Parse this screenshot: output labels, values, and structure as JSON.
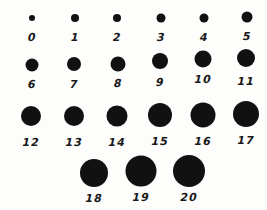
{
  "colors": {
    "dot": "#111111",
    "label": "#1a1a1a",
    "background": "#fdfdfc"
  },
  "dots": [
    {
      "label": "0",
      "x": 32,
      "y": 18,
      "d": 6,
      "ly": 37
    },
    {
      "label": "1",
      "x": 75,
      "y": 18,
      "d": 8,
      "ly": 37
    },
    {
      "label": "2",
      "x": 117,
      "y": 18,
      "d": 8,
      "ly": 37
    },
    {
      "label": "3",
      "x": 161,
      "y": 18,
      "d": 9,
      "ly": 37
    },
    {
      "label": "4",
      "x": 204,
      "y": 18,
      "d": 9,
      "ly": 37
    },
    {
      "label": "5",
      "x": 247,
      "y": 17,
      "d": 11,
      "ly": 36
    },
    {
      "label": "6",
      "x": 32,
      "y": 65,
      "d": 13,
      "ly": 84
    },
    {
      "label": "7",
      "x": 74,
      "y": 64,
      "d": 14,
      "ly": 84
    },
    {
      "label": "8",
      "x": 118,
      "y": 64,
      "d": 15,
      "ly": 83
    },
    {
      "label": "9",
      "x": 160,
      "y": 61,
      "d": 16,
      "ly": 82
    },
    {
      "label": "10",
      "x": 203,
      "y": 59,
      "d": 17,
      "ly": 79
    },
    {
      "label": "11",
      "x": 246,
      "y": 58,
      "d": 18,
      "ly": 81
    },
    {
      "label": "12",
      "x": 31,
      "y": 116,
      "d": 20,
      "ly": 142
    },
    {
      "label": "13",
      "x": 74,
      "y": 116,
      "d": 20,
      "ly": 142
    },
    {
      "label": "14",
      "x": 117,
      "y": 116,
      "d": 21,
      "ly": 142
    },
    {
      "label": "15",
      "x": 160,
      "y": 115,
      "d": 24,
      "ly": 141
    },
    {
      "label": "16",
      "x": 203,
      "y": 115,
      "d": 25,
      "ly": 141
    },
    {
      "label": "17",
      "x": 246,
      "y": 114,
      "d": 26,
      "ly": 140
    },
    {
      "label": "18",
      "x": 94,
      "y": 173,
      "d": 28,
      "ly": 198
    },
    {
      "label": "19",
      "x": 141,
      "y": 171,
      "d": 31,
      "ly": 197
    },
    {
      "label": "20",
      "x": 189,
      "y": 171,
      "d": 32,
      "ly": 197
    }
  ]
}
